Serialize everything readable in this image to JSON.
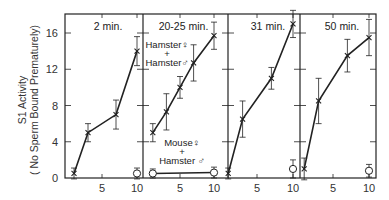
{
  "chart_data": {
    "type": "line",
    "ylabel_line1": "S1 Activity",
    "ylabel_line2": "( No Sperm Bound Prematurely)",
    "yticks": [
      0,
      4,
      8,
      12,
      16
    ],
    "ylim": [
      0,
      18
    ],
    "xticks": [
      5,
      10
    ],
    "panels": [
      {
        "title": "2 min.",
        "series": [
          {
            "name": "Hamster ♀ + Hamster ♂",
            "marker": "x",
            "x": [
              1,
              3,
              7,
              10
            ],
            "y": [
              0.5,
              5,
              7,
              14
            ],
            "err": [
              0.6,
              1,
              1.6,
              1.6
            ]
          },
          {
            "name": "Mouse ♀ + Hamster ♂",
            "marker": "o",
            "x": [
              10
            ],
            "y": [
              0.5
            ],
            "err": [
              0.6
            ]
          }
        ]
      },
      {
        "title": "20-25 min.",
        "annotations": [
          "Hamster♀",
          "+",
          "Hamster♂",
          "Mouse♀",
          "+",
          "Hamster ♂"
        ],
        "series": [
          {
            "name": "Hamster ♀ + Hamster ♂",
            "marker": "x",
            "x": [
              1,
              3,
              5,
              7,
              10
            ],
            "y": [
              5,
              7.3,
              10,
              12.7,
              15.7
            ],
            "err": [
              1,
              2,
              1.2,
              2,
              1.5
            ]
          },
          {
            "name": "Mouse ♀ + Hamster ♂",
            "marker": "o",
            "x": [
              1,
              10
            ],
            "y": [
              0.5,
              0.6
            ],
            "err": [
              0.5,
              0.6
            ]
          }
        ]
      },
      {
        "title": "31 min.",
        "series": [
          {
            "name": "Hamster ♀ + Hamster ♂",
            "marker": "x",
            "x": [
              1,
              3,
              7,
              10
            ],
            "y": [
              0.5,
              6.5,
              11,
              17
            ],
            "err": [
              0.6,
              2,
              1.2,
              1.5
            ]
          },
          {
            "name": "Mouse ♀ + Hamster ♂",
            "marker": "o",
            "x": [
              10
            ],
            "y": [
              1
            ],
            "err": [
              1
            ]
          }
        ]
      },
      {
        "title": "50 min.",
        "series": [
          {
            "name": "Hamster ♀ + Hamster ♂",
            "marker": "x",
            "x": [
              1,
              3,
              7,
              10
            ],
            "y": [
              1,
              8.5,
              13.5,
              15.5
            ],
            "err": [
              1.2,
              2.5,
              1.8,
              2
            ]
          },
          {
            "name": "Mouse ♀ + Hamster ♂",
            "marker": "o",
            "x": [
              10
            ],
            "y": [
              0.8
            ],
            "err": [
              0.7
            ]
          }
        ]
      }
    ]
  }
}
